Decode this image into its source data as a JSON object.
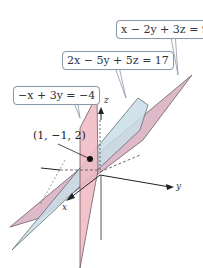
{
  "figure": {
    "planes": [
      {
        "id": "plane-1",
        "equation": "x − 2y + 3z = 9",
        "color": "#d8aebf"
      },
      {
        "id": "plane-2",
        "equation": "2x − 5y + 5z = 17",
        "color": "#c9dde6"
      },
      {
        "id": "plane-3",
        "equation": "−x + 3y = −4",
        "color": "#f0b9c2"
      }
    ],
    "intersection_point": {
      "label": "(1, −1, 2)",
      "coords": [
        1,
        -1,
        2
      ]
    },
    "axes": {
      "x": "x",
      "y": "y",
      "z": "z"
    }
  }
}
